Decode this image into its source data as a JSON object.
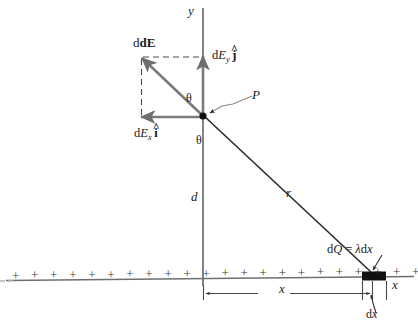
{
  "figure": {
    "kind": "physics-diagram",
    "colors": {
      "ink": "#1a1a1a",
      "line_gray": "#6e6e6e",
      "vector_gray": "#7a7a7a",
      "charge_block": "#111111",
      "background": "#ffffff"
    }
  },
  "axes": {
    "y_label": "y",
    "x_label": "x"
  },
  "point": {
    "label": "P"
  },
  "angles": {
    "upper": "θ",
    "lower": "θ"
  },
  "distances": {
    "vertical": "d",
    "radial": "r",
    "horizontal": "x",
    "element_width": "dx"
  },
  "vectors": {
    "resultant": "dE",
    "y_component": {
      "d": "d",
      "E": "E",
      "sub": "y",
      "unit": "j"
    },
    "x_component": {
      "d": "d",
      "E": "E",
      "sub": "x",
      "unit": "i"
    }
  },
  "charge_element": {
    "label_dQ": "dQ",
    "equals": "=",
    "label_lambda_dx": "λdx"
  },
  "charge_line": {
    "sign": "+",
    "count": 22
  }
}
